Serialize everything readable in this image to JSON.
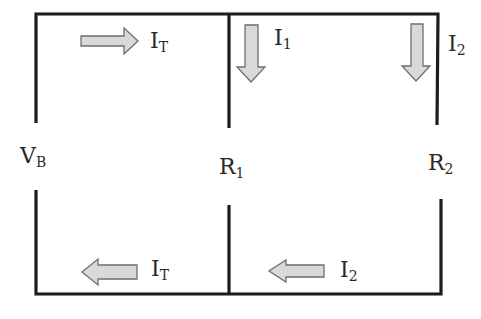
{
  "diagram": {
    "type": "parallel-circuit",
    "colors": {
      "wire": "#1c1c1c",
      "arrow_fill": "#d9d9d9",
      "arrow_stroke": "#6e6e6e",
      "text": "#2a2a2a"
    },
    "components": [
      {
        "id": "battery",
        "label": "V",
        "sub": "B"
      },
      {
        "id": "r1",
        "label": "R",
        "sub": "1"
      },
      {
        "id": "r2",
        "label": "R",
        "sub": "2"
      }
    ],
    "currents": [
      {
        "id": "it_top",
        "label": "I",
        "sub": "T",
        "direction": "right",
        "position": "top-left branch"
      },
      {
        "id": "i1",
        "label": "I",
        "sub": "1",
        "direction": "down",
        "position": "R1 branch"
      },
      {
        "id": "i2_top",
        "label": "I",
        "sub": "2",
        "direction": "down",
        "position": "R2 branch"
      },
      {
        "id": "it_bottom",
        "label": "I",
        "sub": "T",
        "direction": "left",
        "position": "bottom-left branch"
      },
      {
        "id": "i2_bottom",
        "label": "I",
        "sub": "2",
        "direction": "left",
        "position": "bottom-right branch"
      }
    ]
  }
}
